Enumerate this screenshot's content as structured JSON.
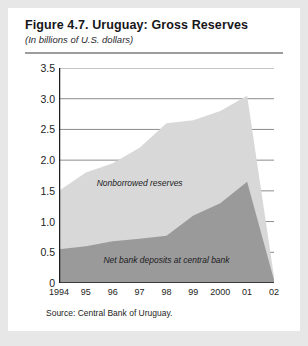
{
  "figure": {
    "title": "Figure 4.7. Uruguay: Gross Reserves",
    "subtitle": "(In billions of U.S. dollars)",
    "source": "Source: Central Bank of Uruguay."
  },
  "colors": {
    "card_background": "#ffffff",
    "page_background": "#e7e7e7",
    "nonborrowed_reserves": "#d8d8d8",
    "net_bank_deposits": "#9a9a9a",
    "gridline": "#8c8c8c",
    "axis": "#1d1d21",
    "title_rule": "#9d9d9d"
  },
  "chart_data": {
    "type": "area",
    "stacked": true,
    "title": "Figure 4.7. Uruguay: Gross Reserves",
    "subtitle": "(In billions of U.S. dollars)",
    "xlabel": "",
    "ylabel": "",
    "x": [
      "1994",
      "95",
      "96",
      "97",
      "98",
      "99",
      "2000",
      "01",
      "02"
    ],
    "xtick_labels": [
      "1994",
      "95",
      "96",
      "97",
      "98",
      "99",
      "2000",
      "01",
      "02"
    ],
    "ytick_labels": [
      "0",
      "0.5",
      "1.0",
      "1.5",
      "2.0",
      "2.5",
      "3.0",
      "3.5"
    ],
    "ytick_values": [
      0,
      0.5,
      1.0,
      1.5,
      2.0,
      2.5,
      3.0,
      3.5
    ],
    "ylim": [
      0,
      3.5
    ],
    "grid": "horizontal",
    "legend": "in-plot annotations",
    "series": [
      {
        "name": "Net bank deposits at central bank",
        "color": "#9a9a9a",
        "order": "bottom",
        "values": [
          0.55,
          0.6,
          0.68,
          0.72,
          0.77,
          1.1,
          1.3,
          1.65,
          0.05
        ]
      },
      {
        "name": "Nonborrowed reserves",
        "color": "#d8d8d8",
        "order": "top",
        "values": [
          0.95,
          1.2,
          1.27,
          1.48,
          1.83,
          1.55,
          1.5,
          1.4,
          0.05
        ]
      }
    ],
    "stack_totals": [
      1.5,
      1.8,
      1.95,
      2.2,
      2.6,
      2.65,
      2.8,
      3.05,
      0.1
    ],
    "annotations": [
      {
        "text": "Nonborrowed reserves",
        "x": "97",
        "y": 1.63
      },
      {
        "text": "Net bank deposits at central bank",
        "x": "98",
        "y": 0.38
      }
    ]
  }
}
